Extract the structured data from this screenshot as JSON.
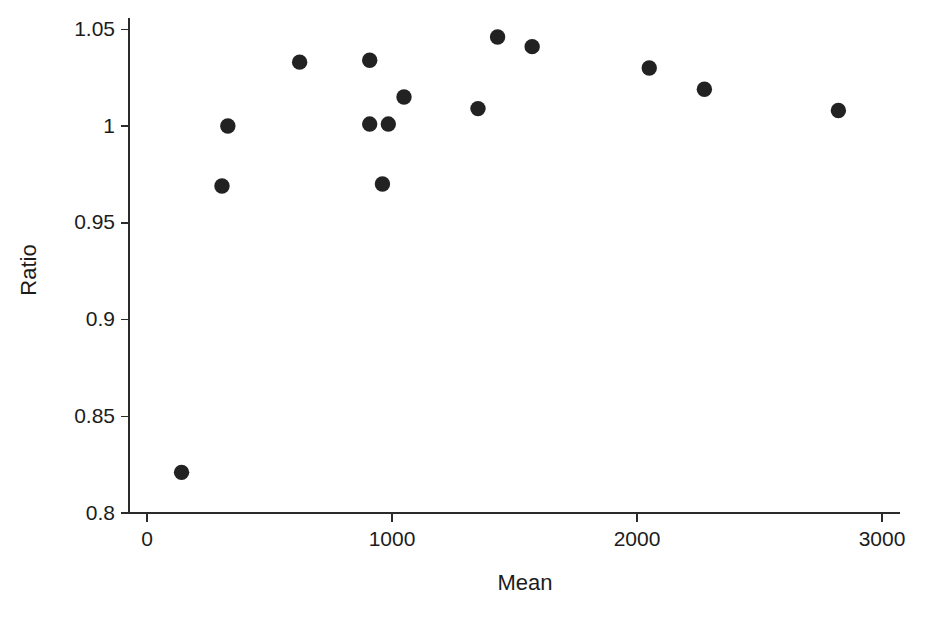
{
  "chart_data": {
    "type": "scatter",
    "title": "",
    "subtitle": "",
    "xlabel": "Mean",
    "ylabel": "Ratio",
    "xlim": [
      0,
      3000
    ],
    "ylim": [
      0.8,
      1.05
    ],
    "xticks": [
      0,
      1000,
      2000,
      3000
    ],
    "xticklabels": [
      "0",
      "1000",
      "2000",
      "3000"
    ],
    "yticks": [
      0.8,
      0.85,
      0.9,
      0.95,
      1,
      1.05
    ],
    "yticklabels": [
      "0.8",
      "0.85",
      "0.9",
      "0.95",
      "1",
      "1.05"
    ],
    "grid": false,
    "legend": null,
    "annotations": [],
    "marker": {
      "shape": "circle",
      "color": "#222222",
      "size": 9
    },
    "series": [
      {
        "name": "Ratio vs Mean",
        "points": [
          {
            "x": 141,
            "y": 0.821
          },
          {
            "x": 306,
            "y": 0.969
          },
          {
            "x": 330,
            "y": 1.0
          },
          {
            "x": 623,
            "y": 1.033
          },
          {
            "x": 909,
            "y": 1.034
          },
          {
            "x": 909,
            "y": 1.001
          },
          {
            "x": 961,
            "y": 0.97
          },
          {
            "x": 985,
            "y": 1.001
          },
          {
            "x": 1049,
            "y": 1.015
          },
          {
            "x": 1351,
            "y": 1.009
          },
          {
            "x": 1431,
            "y": 1.046
          },
          {
            "x": 1572,
            "y": 1.041
          },
          {
            "x": 2050,
            "y": 1.03
          },
          {
            "x": 2275,
            "y": 1.019
          },
          {
            "x": 2822,
            "y": 1.008
          }
        ]
      }
    ]
  },
  "axes": {
    "x_title": "Mean",
    "y_title": "Ratio"
  }
}
